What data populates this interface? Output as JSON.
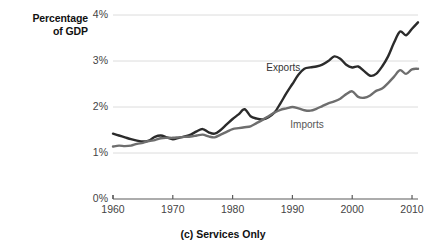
{
  "chart_data": {
    "type": "line",
    "title": "",
    "caption": "(c) Services Only",
    "ylabel": "Percentage of GDP",
    "xlabel": "",
    "grid": true,
    "legend_position": "inline-annotations",
    "xlim": [
      1960,
      2011
    ],
    "ylim": [
      0,
      4
    ],
    "yticks": [
      "0%",
      "1%",
      "2%",
      "3%",
      "4%"
    ],
    "ytick_values": [
      0,
      1,
      2,
      3,
      4
    ],
    "xticks": [
      "1960",
      "1970",
      "1980",
      "1990",
      "2000",
      "2010"
    ],
    "xtick_values": [
      1960,
      1970,
      1980,
      1990,
      2000,
      2010
    ],
    "x": [
      1960,
      1961,
      1962,
      1963,
      1964,
      1965,
      1966,
      1967,
      1968,
      1969,
      1970,
      1971,
      1972,
      1973,
      1974,
      1975,
      1976,
      1977,
      1978,
      1979,
      1980,
      1981,
      1982,
      1983,
      1984,
      1985,
      1986,
      1987,
      1988,
      1989,
      1990,
      1991,
      1992,
      1993,
      1994,
      1995,
      1996,
      1997,
      1998,
      1999,
      2000,
      2001,
      2002,
      2003,
      2004,
      2005,
      2006,
      2007,
      2008,
      2009,
      2010,
      2011
    ],
    "series": [
      {
        "name": "Exports",
        "color": "#2b2b2b",
        "label_x": 1992,
        "label_y": 2.85,
        "values": [
          1.42,
          1.38,
          1.34,
          1.3,
          1.27,
          1.25,
          1.27,
          1.35,
          1.38,
          1.34,
          1.3,
          1.33,
          1.36,
          1.4,
          1.47,
          1.52,
          1.45,
          1.42,
          1.5,
          1.62,
          1.74,
          1.84,
          1.95,
          1.8,
          1.75,
          1.73,
          1.78,
          1.88,
          2.08,
          2.3,
          2.5,
          2.7,
          2.83,
          2.86,
          2.88,
          2.92,
          3.0,
          3.1,
          3.05,
          2.92,
          2.86,
          2.88,
          2.78,
          2.68,
          2.72,
          2.88,
          3.1,
          3.4,
          3.64,
          3.56,
          3.7,
          3.84
        ]
      },
      {
        "name": "Imports",
        "color": "#6e6e6e",
        "label_x": 1993,
        "label_y": 1.6,
        "values": [
          1.14,
          1.16,
          1.15,
          1.16,
          1.2,
          1.22,
          1.26,
          1.28,
          1.32,
          1.33,
          1.33,
          1.34,
          1.35,
          1.36,
          1.38,
          1.4,
          1.36,
          1.34,
          1.4,
          1.46,
          1.52,
          1.54,
          1.56,
          1.58,
          1.65,
          1.72,
          1.8,
          1.88,
          1.94,
          1.97,
          2.0,
          1.97,
          1.93,
          1.92,
          1.96,
          2.02,
          2.08,
          2.12,
          2.18,
          2.28,
          2.34,
          2.22,
          2.2,
          2.25,
          2.35,
          2.4,
          2.52,
          2.66,
          2.8,
          2.72,
          2.82,
          2.83
        ]
      }
    ]
  }
}
